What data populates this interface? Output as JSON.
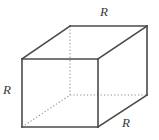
{
  "figure": {
    "name": "cube-diagram",
    "width": 159,
    "height": 140,
    "background_color": "#ffffff",
    "solid_edge_color": "#4a4a4a",
    "hidden_edge_color": "#8d8d8d"
  },
  "labels": {
    "top": "R",
    "left": "R",
    "bottom_right": "R"
  },
  "geometry": {
    "front_face": {
      "top_left": [
        22,
        59
      ],
      "top_right": [
        98,
        59
      ],
      "bottom_right": [
        98,
        127
      ],
      "bottom_left": [
        22,
        127
      ]
    },
    "back_face": {
      "top_left": [
        70,
        26
      ],
      "top_right": [
        147,
        26
      ],
      "bottom_right": [
        147,
        95
      ],
      "bottom_left": [
        70,
        95
      ]
    },
    "solid_edges": [
      [
        [
          22,
          59
        ],
        [
          98,
          59
        ]
      ],
      [
        [
          98,
          59
        ],
        [
          98,
          127
        ]
      ],
      [
        [
          98,
          127
        ],
        [
          22,
          127
        ]
      ],
      [
        [
          22,
          127
        ],
        [
          22,
          59
        ]
      ],
      [
        [
          22,
          59
        ],
        [
          70,
          26
        ]
      ],
      [
        [
          98,
          59
        ],
        [
          147,
          26
        ]
      ],
      [
        [
          70,
          26
        ],
        [
          147,
          26
        ]
      ],
      [
        [
          147,
          26
        ],
        [
          147,
          95
        ]
      ],
      [
        [
          98,
          127
        ],
        [
          147,
          95
        ]
      ]
    ],
    "hidden_edges": [
      [
        [
          70,
          26
        ],
        [
          70,
          95
        ]
      ],
      [
        [
          70,
          95
        ],
        [
          147,
          95
        ]
      ],
      [
        [
          22,
          127
        ],
        [
          70,
          95
        ]
      ]
    ]
  }
}
